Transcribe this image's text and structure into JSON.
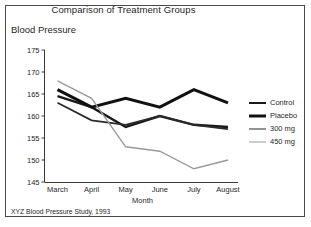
{
  "figure": {
    "title": "Comparison of Treatment Groups",
    "y_axis_label": "Blood Pressure",
    "x_axis_label": "Month",
    "footnote": "XYZ Blood Pressure Study, 1993"
  },
  "legend": {
    "position": "right",
    "entries": [
      {
        "label": "Control",
        "color": "#1a1a1a",
        "width": 2.4
      },
      {
        "label": "Placebo",
        "color": "#111111",
        "width": 3.0
      },
      {
        "label": "300 mg",
        "color": "#2b2b2b",
        "width": 1.8
      },
      {
        "label": "450 mg",
        "color": "#9a9a9a",
        "width": 1.4
      }
    ]
  },
  "chart_data": {
    "type": "line",
    "title": "Comparison of Treatment Groups",
    "xlabel": "Month",
    "ylabel": "Blood Pressure",
    "categories": [
      "March",
      "April",
      "May",
      "June",
      "July",
      "August"
    ],
    "ylim": [
      145,
      175
    ],
    "yticks": [
      145,
      150,
      155,
      160,
      165,
      170,
      175
    ],
    "ytick_labels": [
      "145",
      "170",
      "175",
      "165",
      "160",
      "155",
      "150"
    ],
    "grid": false,
    "series": [
      {
        "name": "Control",
        "color": "#1a1a1a",
        "values": [
          164.5,
          162.0,
          157.5,
          160.0,
          158.0,
          157.5
        ]
      },
      {
        "name": "Placebo",
        "color": "#111111",
        "values": [
          166.0,
          162.0,
          164.0,
          162.0,
          166.0,
          163.0
        ]
      },
      {
        "name": "300 mg",
        "color": "#2b2b2b",
        "values": [
          163.0,
          159.0,
          158.0,
          160.0,
          158.0,
          157.0
        ]
      },
      {
        "name": "450 mg",
        "color": "#9a9a9a",
        "values": [
          168.0,
          164.0,
          153.0,
          152.0,
          148.0,
          150.0
        ]
      }
    ]
  },
  "axis": {
    "y_ticks": [
      "175",
      "170",
      "165",
      "160",
      "155",
      "150",
      "145"
    ],
    "x_ticks": [
      "March",
      "April",
      "May",
      "June",
      "July",
      "August"
    ]
  }
}
